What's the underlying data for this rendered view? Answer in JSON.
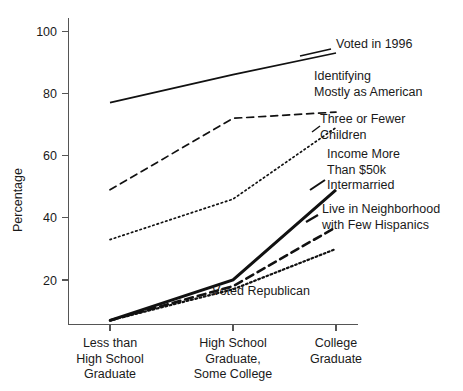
{
  "chart_data": {
    "type": "line",
    "title": "",
    "xlabel": "",
    "ylabel": "Percentage",
    "ylim": [
      0,
      108
    ],
    "yticks": [
      20,
      40,
      60,
      80,
      100
    ],
    "ytick_labels": [
      "20",
      "40",
      "60",
      "80",
      "100"
    ],
    "grid": false,
    "legend_position": "right-inline-labels",
    "categories": [
      "Less than\nHigh School\nGraduate",
      "High School\nGraduate,\nSome College",
      "College\nGraduate"
    ],
    "category_lines": [
      [
        "Less than",
        "High School",
        "Graduate"
      ],
      [
        "High School",
        "Graduate,",
        "Some College"
      ],
      [
        "College",
        "Graduate"
      ]
    ],
    "series": [
      {
        "name": "Voted in 1996",
        "label_lines": [
          "Voted in 1996"
        ],
        "style": "solid",
        "stroke_width": 1.7,
        "dash": "none",
        "values": [
          77,
          86,
          93
        ],
        "label_x": 336,
        "label_y": 48,
        "leader": true
      },
      {
        "name": "Identifying Mostly as American",
        "label_lines": [
          "Identifying",
          "Mostly as American"
        ],
        "style": "dashed",
        "stroke_width": 1.7,
        "dash": "7,5",
        "values": [
          49,
          72,
          74
        ],
        "label_x": 314,
        "label_y": 80,
        "leader": false
      },
      {
        "name": "Three or Fewer Children",
        "label_lines": [
          "Three or Fewer",
          "Children"
        ],
        "style": "dotted",
        "stroke_width": 1.7,
        "dash": "1.5,3",
        "values": [
          33,
          46,
          69
        ],
        "label_x": 320,
        "label_y": 123,
        "leader": true
      },
      {
        "name": "Intermarried",
        "label_lines": [
          "Income More",
          "Than $50k",
          "Intermarried"
        ],
        "style": "solid-thick",
        "stroke_width": 3.0,
        "dash": "none",
        "values": [
          7,
          20,
          49
        ],
        "label_x": 327,
        "label_y": 158,
        "leader": true
      },
      {
        "name": "Live in Neighborhood with Few Hispanics",
        "label_lines": [
          "Live in Neighborhood",
          "with Few Hispanics"
        ],
        "style": "dashed-thick",
        "stroke_width": 2.6,
        "dash": "8,5",
        "values": [
          7,
          18,
          37
        ],
        "label_x": 322,
        "label_y": 213,
        "leader": true
      },
      {
        "name": "Voted Republican",
        "label_lines": [
          "Voted Republican"
        ],
        "style": "dotted-thick",
        "stroke_width": 2.2,
        "dash": "1.8,2.6",
        "values": [
          7,
          17,
          30
        ],
        "label_x": 212,
        "label_y": 295,
        "leader": false
      }
    ],
    "annotations": [
      {
        "text": "Income More",
        "x": 327,
        "y": 158
      },
      {
        "text": "Than $50k",
        "x": 327,
        "y": 172
      }
    ]
  }
}
